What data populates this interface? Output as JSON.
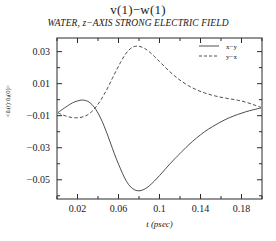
{
  "chart_data": {
    "type": "line",
    "title": "v(1)−w(1)",
    "subtitle": "WATER, z−AXIS STRONG ELECTRIC FIELD",
    "xlabel": "t (psec)",
    "ylabel": "<ũᵢ(t)·ũⱼ(0)>",
    "xlim": [
      0.0,
      0.2
    ],
    "ylim": [
      -0.062,
      0.0385
    ],
    "grid": false,
    "legend_position": "top-right",
    "xticks": [
      0.02,
      0.06,
      0.1,
      0.14,
      0.18
    ],
    "xtick_labels": [
      "0.02",
      "0.06",
      "0.1",
      "0.14",
      "0.18"
    ],
    "yticks": [
      0.03,
      0.01,
      -0.01,
      -0.03,
      -0.05
    ],
    "ytick_labels": [
      "0.03",
      "0.01",
      "−0.01",
      "−0.03",
      "−0.05"
    ],
    "x_minor_step": 0.02,
    "y_minor_step": 0.01,
    "series": [
      {
        "name": "x−y",
        "style": "solid",
        "color": "#3a3a3a",
        "x": [
          0.001,
          0.005,
          0.01,
          0.015,
          0.02,
          0.025,
          0.03,
          0.034,
          0.038,
          0.042,
          0.046,
          0.05,
          0.054,
          0.058,
          0.062,
          0.066,
          0.07,
          0.074,
          0.078,
          0.082,
          0.086,
          0.09,
          0.095,
          0.1,
          0.105,
          0.11,
          0.115,
          0.12,
          0.128,
          0.136,
          0.144,
          0.152,
          0.16,
          0.168,
          0.176,
          0.184,
          0.192,
          0.199
        ],
        "y": [
          -0.008,
          -0.0062,
          -0.004,
          -0.002,
          -0.0008,
          -0.0002,
          -0.001,
          -0.003,
          -0.0062,
          -0.0108,
          -0.0165,
          -0.0232,
          -0.0303,
          -0.0371,
          -0.0432,
          -0.0489,
          -0.0531,
          -0.0556,
          -0.0568,
          -0.0567,
          -0.0556,
          -0.0538,
          -0.0508,
          -0.0474,
          -0.0438,
          -0.0402,
          -0.0368,
          -0.0336,
          -0.0285,
          -0.024,
          -0.02,
          -0.0167,
          -0.0138,
          -0.0113,
          -0.0093,
          -0.0076,
          -0.0062,
          -0.0052
        ]
      },
      {
        "name": "y−x",
        "style": "dashed",
        "color": "#3a3a3a",
        "x": [
          0.001,
          0.005,
          0.01,
          0.014,
          0.018,
          0.022,
          0.026,
          0.03,
          0.034,
          0.038,
          0.042,
          0.046,
          0.05,
          0.054,
          0.058,
          0.062,
          0.066,
          0.07,
          0.074,
          0.078,
          0.082,
          0.086,
          0.09,
          0.095,
          0.1,
          0.105,
          0.11,
          0.115,
          0.12,
          0.128,
          0.136,
          0.144,
          0.152,
          0.16,
          0.168,
          0.176,
          0.184,
          0.192,
          0.199
        ],
        "y": [
          -0.0082,
          -0.0094,
          -0.0105,
          -0.0111,
          -0.0113,
          -0.0112,
          -0.0106,
          -0.0094,
          -0.0074,
          -0.0046,
          -0.001,
          0.0033,
          0.0081,
          0.0133,
          0.0184,
          0.0233,
          0.0277,
          0.0309,
          0.0328,
          0.0334,
          0.033,
          0.0318,
          0.0299,
          0.027,
          0.0238,
          0.0206,
          0.0175,
          0.0147,
          0.0122,
          0.0088,
          0.0062,
          0.0042,
          0.0027,
          0.0015,
          0.0006,
          -0.0003,
          -0.0015,
          -0.0032,
          -0.0048
        ]
      }
    ]
  }
}
